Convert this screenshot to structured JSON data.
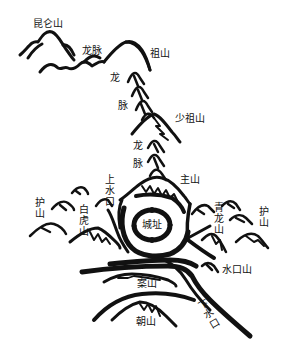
{
  "diagram": {
    "type": "feng-shui-landscape",
    "ink_color": "#111111",
    "background": "#ffffff"
  },
  "labels": {
    "kunlun": "昆仑山",
    "longmai_top": "龙脉",
    "zushan": "祖山",
    "long1": "龙",
    "mai1": "脉",
    "shaozushan": "少祖山",
    "long2": "龙",
    "mai2": "脉",
    "zhushan": "主山",
    "shangshuikou": "上水口",
    "hushan_left": "护山",
    "baihushan": "白虎山",
    "chengzhi": "城址",
    "qinglongshan": "青龙山",
    "hushan_right": "护山",
    "shuikoushan": "水口山",
    "anshan": "案山",
    "xiashuikou": "下水口",
    "chaoshan": "朝山"
  }
}
